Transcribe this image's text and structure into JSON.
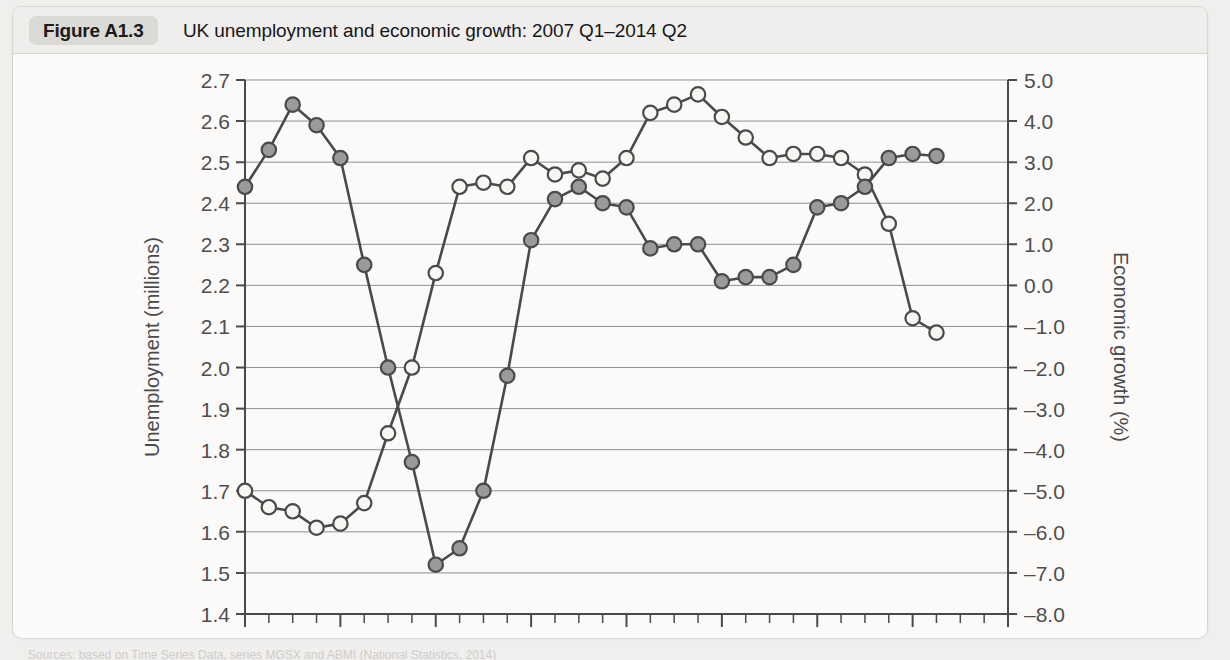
{
  "figure": {
    "badge": "Figure A1.3",
    "title": "UK unemployment and economic growth: 2007 Q1–2014 Q2",
    "source_note": "Sources: based on Time Series Data, series MGSX and ABMI (National Statistics, 2014)"
  },
  "chart_data": {
    "type": "line",
    "title": "UK unemployment and economic growth: 2007 Q1–2014 Q2",
    "xlabel": "",
    "ylabel": "Unemployment (millions)",
    "y2label": "Economic growth (%)",
    "ylim": [
      1.4,
      2.7
    ],
    "y2lim": [
      -8.0,
      5.0
    ],
    "grid": true,
    "legend_position": "none",
    "x_tick_labels": [
      "2007",
      "2008",
      "2009",
      "2010",
      "2011",
      "2012",
      "2013",
      "2014"
    ],
    "x_minor_ticks_per_year": 4,
    "y_tick_labels": [
      "1.4",
      "1.5",
      "1.6",
      "1.7",
      "1.8",
      "1.9",
      "2.0",
      "2.1",
      "2.2",
      "2.3",
      "2.4",
      "2.5",
      "2.6",
      "2.7"
    ],
    "y2_tick_labels": [
      "-8.0",
      "-7.0",
      "-6.0",
      "-5.0",
      "-4.0",
      "-3.0",
      "-2.0",
      "-1.0",
      "0.0",
      "1.0",
      "2.0",
      "3.0",
      "4.0",
      "5.0"
    ],
    "x": [
      "2007 Q1",
      "2007 Q2",
      "2007 Q3",
      "2007 Q4",
      "2008 Q1",
      "2008 Q2",
      "2008 Q3",
      "2008 Q4",
      "2009 Q1",
      "2009 Q2",
      "2009 Q3",
      "2009 Q4",
      "2010 Q1",
      "2010 Q2",
      "2010 Q3",
      "2010 Q4",
      "2011 Q1",
      "2011 Q2",
      "2011 Q3",
      "2011 Q4",
      "2012 Q1",
      "2012 Q2",
      "2012 Q3",
      "2012 Q4",
      "2013 Q1",
      "2013 Q2",
      "2013 Q3",
      "2013 Q4",
      "2014 Q1",
      "2014 Q2"
    ],
    "series": [
      {
        "name": "Unemployment (millions)",
        "axis": "left",
        "marker": "open-circle",
        "marker_fill": "#f7f6f3",
        "color": "#4a4a4c",
        "values": [
          1.7,
          1.66,
          1.65,
          1.61,
          1.62,
          1.67,
          1.84,
          2.0,
          2.23,
          2.44,
          2.45,
          2.44,
          2.51,
          2.47,
          2.48,
          2.46,
          2.51,
          2.62,
          2.64,
          2.665,
          2.61,
          2.56,
          2.51,
          2.52,
          2.52,
          2.51,
          2.47,
          2.35,
          2.12,
          2.085
        ]
      },
      {
        "name": "Economic growth (%)",
        "axis": "right",
        "marker": "filled-circle",
        "marker_fill": "#9a9a99",
        "color": "#4a4a4c",
        "values": [
          2.4,
          3.3,
          4.4,
          3.9,
          3.1,
          0.5,
          -2.0,
          -4.3,
          -6.8,
          -6.4,
          -5.0,
          -2.2,
          1.1,
          2.1,
          2.4,
          2.0,
          1.9,
          0.9,
          1.0,
          1.0,
          0.1,
          0.2,
          0.2,
          0.5,
          1.9,
          2.0,
          2.4,
          3.1,
          3.2,
          3.15
        ]
      }
    ]
  }
}
